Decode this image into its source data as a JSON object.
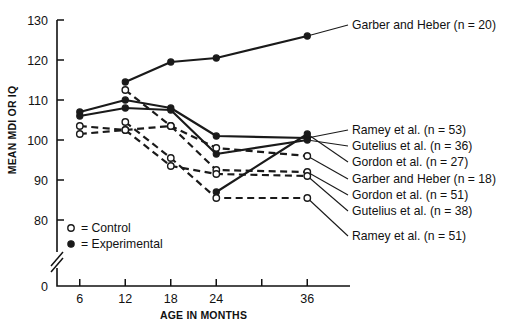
{
  "chart_data": {
    "type": "line",
    "title": "",
    "xlabel": "AGE IN MONTHS",
    "ylabel": "MEAN MDI OR IQ",
    "x": [
      6,
      12,
      18,
      24,
      36
    ],
    "xticks": [
      6,
      12,
      18,
      24,
      30,
      36
    ],
    "xtick_labels": [
      "6",
      "12",
      "18",
      "24",
      "",
      "36"
    ],
    "yticks": [
      80,
      90,
      100,
      110,
      120,
      130
    ],
    "ytick_labels": [
      "80",
      "90",
      "100",
      "110",
      "120",
      "130"
    ],
    "ylim": [
      80,
      130
    ],
    "xlim": [
      3,
      39
    ],
    "axis_break": true,
    "axis_break_label": "0",
    "grid": false,
    "legend_position": "inline-right",
    "key": {
      "title": "",
      "entries": [
        {
          "marker": "open-circle",
          "symbol": "○",
          "label": "= Control"
        },
        {
          "marker": "filled-circle",
          "symbol": "●",
          "label": "= Experimental"
        }
      ]
    },
    "series": [
      {
        "name": "Garber and Heber (n = 20)",
        "group": "Experimental",
        "marker": "filled-circle",
        "line_style": "solid",
        "label_anchor_y": 29,
        "x": [
          12,
          18,
          24,
          36
        ],
        "values": [
          114.5,
          119.5,
          120.5,
          126.0
        ]
      },
      {
        "name": "Ramey et al. (n = 53)",
        "group": "Experimental",
        "marker": "filled-circle",
        "line_style": "solid",
        "label_anchor_y": 134,
        "x": [
          6,
          12,
          18,
          24,
          36
        ],
        "values": [
          107.0,
          110.0,
          108.0,
          101.0,
          100.5
        ]
      },
      {
        "name": "Gutelius et al. (n = 36)",
        "group": "Experimental",
        "marker": "filled-circle",
        "line_style": "solid",
        "label_anchor_y": 150,
        "x": [
          6,
          12,
          18,
          24,
          36
        ],
        "values": [
          106.0,
          108.0,
          107.5,
          96.5,
          100.0
        ]
      },
      {
        "name": "Gordon et al. (n = 27)",
        "group": "Experimental",
        "marker": "filled-circle",
        "line_style": "solid",
        "label_anchor_y": 166,
        "x": [
          24,
          36
        ],
        "values": [
          87.0,
          101.5
        ]
      },
      {
        "name": "Garber and Heber (n = 18)",
        "group": "Control",
        "marker": "open-circle",
        "line_style": "dashed",
        "label_anchor_y": 183,
        "x": [
          12,
          18,
          24,
          36
        ],
        "values": [
          112.5,
          103.5,
          98.0,
          96.0
        ]
      },
      {
        "name": "Gordon et al. (n = 51)",
        "group": "Control",
        "marker": "open-circle",
        "line_style": "dashed",
        "label_anchor_y": 199,
        "x": [
          6,
          12,
          18,
          24,
          36
        ],
        "values": [
          103.5,
          102.5,
          103.5,
          92.5,
          92.0
        ]
      },
      {
        "name": "Gutelius et al. (n = 38)",
        "group": "Control",
        "marker": "open-circle",
        "line_style": "dashed",
        "label_anchor_y": 215,
        "x": [
          6,
          12,
          18,
          24,
          36
        ],
        "values": [
          101.5,
          102.5,
          93.5,
          91.5,
          91.0
        ]
      },
      {
        "name": "Ramey et al. (n = 51)",
        "group": "Control",
        "marker": "open-circle",
        "line_style": "dashed",
        "label_anchor_y": 240,
        "x": [
          12,
          18,
          24,
          36
        ],
        "values": [
          104.5,
          95.5,
          85.5,
          85.5
        ]
      }
    ]
  }
}
